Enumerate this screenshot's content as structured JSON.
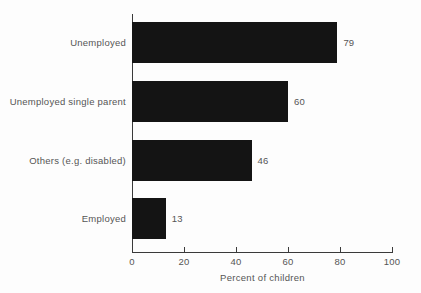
{
  "chart_data": {
    "type": "bar",
    "orientation": "horizontal",
    "title": "",
    "subtitle": "",
    "xlabel": "Percent of children",
    "ylabel": "",
    "categories": [
      "Unemployed",
      "Unemployed single parent",
      "Others (e.g. disabled)",
      "Employed"
    ],
    "values": [
      79,
      60,
      46,
      13
    ],
    "value_labels": [
      "79",
      "60",
      "46",
      "13"
    ],
    "xlim": [
      0,
      100
    ],
    "xticks": [
      0,
      20,
      40,
      60,
      80,
      100
    ],
    "xtick_labels": [
      "0",
      "20",
      "40",
      "60",
      "80",
      "100"
    ],
    "grid": false,
    "legend": null,
    "legend_position": "none",
    "bar_color": "#141414",
    "axis_color": "#3a3a3a",
    "text_color": "#555555",
    "background_color": "#fdfdfd"
  }
}
